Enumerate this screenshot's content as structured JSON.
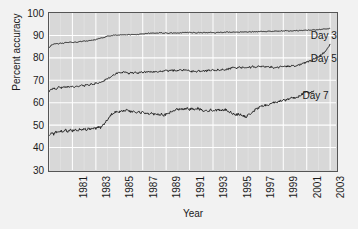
{
  "chart_data": {
    "type": "line",
    "title": "",
    "xlabel": "Year",
    "ylabel": "Percent accuracy",
    "xlim": [
      1981,
      2005.5
    ],
    "ylim": [
      30,
      100
    ],
    "yticks": [
      30,
      40,
      50,
      60,
      70,
      80,
      90,
      100
    ],
    "xticks": [
      1981,
      1983,
      1985,
      1987,
      1989,
      1991,
      1993,
      1995,
      1997,
      1999,
      2001,
      2003,
      2005
    ],
    "grid": true,
    "grid_color": "#ffffff",
    "plot_bg": "#d8d8d8",
    "line_color": "#222222",
    "legend_position": "inline-right",
    "annotations": [
      {
        "text": "Day 3",
        "x": 2003.3,
        "y": 90.0
      },
      {
        "text": "Day 5",
        "x": 2003.3,
        "y": 79.5
      },
      {
        "text": "Day 7",
        "x": 2002.6,
        "y": 63.0
      }
    ],
    "series": [
      {
        "name": "Day 3",
        "label": "Day 3",
        "x": [
          1981.0,
          1981.2,
          1981.4,
          1981.6,
          1981.8,
          1982.0,
          1982.2,
          1982.4,
          1982.6,
          1982.8,
          1983.0,
          1983.2,
          1983.4,
          1983.6,
          1983.8,
          1984.0,
          1984.2,
          1984.4,
          1984.6,
          1984.8,
          1985.0,
          1985.2,
          1985.4,
          1985.6,
          1985.8,
          1986.0,
          1986.2,
          1986.4,
          1986.6,
          1986.8,
          1987.0,
          1987.2,
          1987.4,
          1987.6,
          1987.8,
          1988.0,
          1988.2,
          1988.4,
          1988.6,
          1988.8,
          1989.0,
          1989.2,
          1989.4,
          1989.6,
          1989.8,
          1990.0,
          1990.2,
          1990.4,
          1990.6,
          1990.8,
          1991.0,
          1991.2,
          1991.4,
          1991.6,
          1991.8,
          1992.0,
          1992.2,
          1992.4,
          1992.6,
          1992.8,
          1993.0,
          1993.2,
          1993.4,
          1993.6,
          1993.8,
          1994.0,
          1994.2,
          1994.4,
          1994.6,
          1994.8,
          1995.0,
          1995.2,
          1995.4,
          1995.6,
          1995.8,
          1996.0,
          1996.2,
          1996.4,
          1996.6,
          1996.8,
          1997.0,
          1997.2,
          1997.4,
          1997.6,
          1997.8,
          1998.0,
          1998.2,
          1998.4,
          1998.6,
          1998.8,
          1999.0,
          1999.2,
          1999.4,
          1999.6,
          1999.8,
          2000.0,
          2000.2,
          2000.4,
          2000.6,
          2000.8,
          2001.0,
          2001.2,
          2001.4,
          2001.6,
          2001.8,
          2002.0,
          2002.2,
          2002.4,
          2002.6,
          2002.8,
          2003.0,
          2003.2,
          2003.4,
          2003.6,
          2003.8,
          2004.0,
          2004.2,
          2004.4,
          2004.6,
          2004.8,
          2005.0
        ],
        "y": [
          84.6,
          85.6,
          86.1,
          86.4,
          86.3,
          86.6,
          86.5,
          86.8,
          86.7,
          87.0,
          86.8,
          87.1,
          87.0,
          87.3,
          87.2,
          87.5,
          87.4,
          87.6,
          87.8,
          88.0,
          88.2,
          88.5,
          88.7,
          89.0,
          89.3,
          89.6,
          89.8,
          90.0,
          90.1,
          90.2,
          90.2,
          90.3,
          90.2,
          90.3,
          90.3,
          90.4,
          90.3,
          90.4,
          90.4,
          90.5,
          90.6,
          90.8,
          90.9,
          91.0,
          91.0,
          91.1,
          91.0,
          91.1,
          91.1,
          91.0,
          91.1,
          91.0,
          91.1,
          91.0,
          91.1,
          91.0,
          91.1,
          91.2,
          91.3,
          91.2,
          91.3,
          91.2,
          91.3,
          91.2,
          91.3,
          91.2,
          91.3,
          91.2,
          91.3,
          91.4,
          91.3,
          91.2,
          91.3,
          91.4,
          91.3,
          91.4,
          91.5,
          91.4,
          91.5,
          91.4,
          91.5,
          91.4,
          91.5,
          91.6,
          91.5,
          91.6,
          91.7,
          91.6,
          91.7,
          91.6,
          91.7,
          91.8,
          91.7,
          91.8,
          91.9,
          91.8,
          91.9,
          92.0,
          91.9,
          92.0,
          92.0,
          92.1,
          92.0,
          92.1,
          92.1,
          92.2,
          92.1,
          92.2,
          92.2,
          92.3,
          92.3,
          92.4,
          92.4,
          92.5,
          92.5,
          92.6,
          92.7,
          92.8,
          92.9,
          93.0,
          93.1
        ]
      },
      {
        "name": "Day 5",
        "label": "Day 5",
        "x": [
          1981.0,
          1981.2,
          1981.4,
          1981.6,
          1981.8,
          1982.0,
          1982.2,
          1982.4,
          1982.6,
          1982.8,
          1983.0,
          1983.2,
          1983.4,
          1983.6,
          1983.8,
          1984.0,
          1984.2,
          1984.4,
          1984.6,
          1984.8,
          1985.0,
          1985.2,
          1985.4,
          1985.6,
          1985.8,
          1986.0,
          1986.2,
          1986.4,
          1986.6,
          1986.8,
          1987.0,
          1987.2,
          1987.4,
          1987.6,
          1987.8,
          1988.0,
          1988.2,
          1988.4,
          1988.6,
          1988.8,
          1989.0,
          1989.2,
          1989.4,
          1989.6,
          1989.8,
          1990.0,
          1990.2,
          1990.4,
          1990.6,
          1990.8,
          1991.0,
          1991.2,
          1991.4,
          1991.6,
          1991.8,
          1992.0,
          1992.2,
          1992.4,
          1992.6,
          1992.8,
          1993.0,
          1993.2,
          1993.4,
          1993.6,
          1993.8,
          1994.0,
          1994.2,
          1994.4,
          1994.6,
          1994.8,
          1995.0,
          1995.2,
          1995.4,
          1995.6,
          1995.8,
          1996.0,
          1996.2,
          1996.4,
          1996.6,
          1996.8,
          1997.0,
          1997.2,
          1997.4,
          1997.6,
          1997.8,
          1998.0,
          1998.2,
          1998.4,
          1998.6,
          1998.8,
          1999.0,
          1999.2,
          1999.4,
          1999.6,
          1999.8,
          2000.0,
          2000.2,
          2000.4,
          2000.6,
          2000.8,
          2001.0,
          2001.2,
          2001.4,
          2001.6,
          2001.8,
          2002.0,
          2002.2,
          2002.4,
          2002.6,
          2002.8,
          2003.0,
          2003.2,
          2003.4,
          2003.6,
          2003.8,
          2004.0,
          2004.2,
          2004.4,
          2004.6,
          2004.8,
          2005.0
        ],
        "y": [
          65.0,
          65.8,
          66.6,
          66.2,
          66.9,
          66.5,
          67.1,
          66.8,
          67.2,
          66.9,
          67.3,
          67.0,
          67.5,
          67.2,
          67.8,
          67.4,
          68.1,
          67.8,
          68.4,
          68.2,
          68.8,
          68.5,
          69.2,
          69.6,
          70.2,
          70.8,
          71.4,
          72.0,
          72.6,
          73.2,
          73.6,
          73.2,
          73.8,
          73.4,
          73.0,
          73.5,
          73.1,
          73.6,
          73.2,
          73.7,
          73.4,
          73.8,
          73.5,
          73.9,
          73.6,
          74.0,
          73.7,
          74.1,
          73.8,
          74.2,
          74.4,
          74.1,
          74.5,
          74.2,
          74.6,
          74.3,
          74.7,
          74.4,
          74.8,
          74.5,
          74.2,
          73.9,
          74.2,
          73.9,
          74.3,
          74.0,
          74.4,
          74.1,
          74.5,
          74.2,
          74.6,
          74.3,
          74.7,
          74.4,
          74.8,
          74.5,
          74.9,
          75.2,
          75.5,
          75.8,
          75.4,
          75.9,
          75.5,
          76.0,
          75.6,
          76.1,
          75.7,
          76.2,
          75.8,
          76.3,
          75.9,
          76.2,
          75.8,
          76.1,
          75.7,
          76.0,
          75.6,
          76.0,
          75.7,
          76.1,
          76.3,
          76.0,
          76.4,
          76.1,
          76.5,
          76.2,
          76.6,
          76.9,
          77.3,
          77.7,
          78.1,
          78.5,
          78.9,
          79.4,
          79.9,
          80.5,
          81.2,
          82.0,
          83.0,
          84.2,
          86.2
        ]
      },
      {
        "name": "Day 7",
        "label": "Day 7",
        "x": [
          1981.0,
          1981.2,
          1981.4,
          1981.6,
          1981.8,
          1982.0,
          1982.2,
          1982.4,
          1982.6,
          1982.8,
          1983.0,
          1983.2,
          1983.4,
          1983.6,
          1983.8,
          1984.0,
          1984.2,
          1984.4,
          1984.6,
          1984.8,
          1985.0,
          1985.2,
          1985.4,
          1985.6,
          1985.8,
          1986.0,
          1986.2,
          1986.4,
          1986.6,
          1986.8,
          1987.0,
          1987.2,
          1987.4,
          1987.6,
          1987.8,
          1988.0,
          1988.2,
          1988.4,
          1988.6,
          1988.8,
          1989.0,
          1989.2,
          1989.4,
          1989.6,
          1989.8,
          1990.0,
          1990.2,
          1990.4,
          1990.6,
          1990.8,
          1991.0,
          1991.2,
          1991.4,
          1991.6,
          1991.8,
          1992.0,
          1992.2,
          1992.4,
          1992.6,
          1992.8,
          1993.0,
          1993.2,
          1993.4,
          1993.6,
          1993.8,
          1994.0,
          1994.2,
          1994.4,
          1994.6,
          1994.8,
          1995.0,
          1995.2,
          1995.4,
          1995.6,
          1995.8,
          1996.0,
          1996.2,
          1996.4,
          1996.6,
          1996.8,
          1997.0,
          1997.2,
          1997.4,
          1997.6,
          1997.8,
          1998.0,
          1998.2,
          1998.4,
          1998.6,
          1998.8,
          1999.0,
          1999.2,
          1999.4,
          1999.6,
          1999.8,
          2000.0,
          2000.2,
          2000.4,
          2000.6,
          2000.8,
          2001.0,
          2001.2,
          2001.4,
          2001.6,
          2001.8,
          2002.0,
          2002.2,
          2002.4,
          2002.6,
          2002.8,
          2003.0,
          2003.2,
          2003.4,
          2003.6
        ],
        "y": [
          45.6,
          46.4,
          46.0,
          47.0,
          46.5,
          47.4,
          47.0,
          47.8,
          47.2,
          48.0,
          47.4,
          48.2,
          47.6,
          48.3,
          47.7,
          48.4,
          47.8,
          48.6,
          48.0,
          48.8,
          48.3,
          49.4,
          48.9,
          50.0,
          51.2,
          52.6,
          54.0,
          55.2,
          55.8,
          56.3,
          56.0,
          56.6,
          56.2,
          56.8,
          56.3,
          55.8,
          56.2,
          55.6,
          56.0,
          55.4,
          55.8,
          55.2,
          55.6,
          55.0,
          55.4,
          54.8,
          55.2,
          54.6,
          55.0,
          54.4,
          54.8,
          55.3,
          55.8,
          56.3,
          56.8,
          57.2,
          56.8,
          57.3,
          56.9,
          57.4,
          57.0,
          57.5,
          57.1,
          57.6,
          57.2,
          56.8,
          56.4,
          56.8,
          56.3,
          56.8,
          56.4,
          56.9,
          56.5,
          57.0,
          56.6,
          57.0,
          56.5,
          56.0,
          55.5,
          55.0,
          54.6,
          55.0,
          54.5,
          54.0,
          53.6,
          54.4,
          55.2,
          56.0,
          56.8,
          57.4,
          58.0,
          58.6,
          59.0,
          58.6,
          59.2,
          59.8,
          60.2,
          59.8,
          60.4,
          61.0,
          61.4,
          61.0,
          61.6,
          62.0,
          62.4,
          62.0,
          62.6,
          63.2,
          63.8,
          64.4,
          64.9,
          64.4,
          65.0,
          65.4
        ]
      }
    ]
  },
  "axes": {
    "ylabel": "Percent accuracy",
    "xlabel": "Year",
    "ytick_labels": [
      "100",
      "90",
      "80",
      "70",
      "60",
      "50",
      "40",
      "30"
    ],
    "xtick_labels": [
      "1981",
      "1983",
      "1985",
      "1987",
      "1989",
      "1991",
      "1993",
      "1995",
      "1997",
      "1999",
      "2001",
      "2003",
      "2005"
    ]
  },
  "annotations": {
    "day3": "Day 3",
    "day5": "Day 5",
    "day7": "Day 7"
  }
}
